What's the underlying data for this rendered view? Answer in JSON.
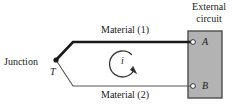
{
  "figure": {
    "type": "thermocouple-circuit-diagram",
    "background_color": "#ffffff",
    "line_color": "#1a1a1a",
    "box_fill_color": "#b3b3b3",
    "box_border_color": "#4d4d4d"
  },
  "labels": {
    "external_circuit": "External circuit",
    "junction": "Junction",
    "temperature": "T",
    "material_1": "Material (1)",
    "material_2": "Material (2)",
    "current": "i",
    "terminal_a": "A",
    "terminal_b": "B"
  },
  "icons": {
    "junction_dot": "filled-dot-icon",
    "terminal_a_node": "open-circle-terminal-icon",
    "terminal_b_node": "open-circle-terminal-icon",
    "current_loop": "clockwise-circular-arrow-icon"
  }
}
